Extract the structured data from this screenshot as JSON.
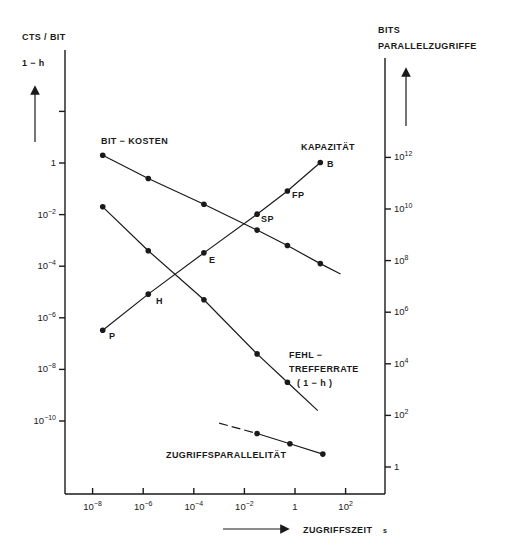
{
  "chart_data": {
    "type": "line",
    "title": "",
    "left_axis": {
      "label_lines": [
        "CTS / BIT",
        "1 − h"
      ],
      "scale": "log",
      "ticks": [
        {
          "exp": 2,
          "label": ""
        },
        {
          "exp": 0,
          "label": "1"
        },
        {
          "exp": -2,
          "label": "10",
          "sup": "−2"
        },
        {
          "exp": -4,
          "label": "10",
          "sup": "−4"
        },
        {
          "exp": -6,
          "label": "10",
          "sup": "−6"
        },
        {
          "exp": -8,
          "label": "10",
          "sup": "−8"
        },
        {
          "exp": -10,
          "label": "10",
          "sup": "−10"
        }
      ]
    },
    "right_axis": {
      "label_lines": [
        "BITS",
        "PARALLELZUGRIFFE"
      ],
      "scale": "log",
      "ticks": [
        {
          "exp": 12,
          "label": "10",
          "sup": "12"
        },
        {
          "exp": 10,
          "label": "10",
          "sup": "10"
        },
        {
          "exp": 8,
          "label": "10",
          "sup": "8"
        },
        {
          "exp": 6,
          "label": "10",
          "sup": "6"
        },
        {
          "exp": 4,
          "label": "10",
          "sup": "4"
        },
        {
          "exp": 2,
          "label": "10",
          "sup": "2"
        },
        {
          "exp": 0,
          "label": "1"
        }
      ]
    },
    "x_axis": {
      "label": "ZUGRIFFSZEIT",
      "unit": "s",
      "scale": "log",
      "ticks": [
        {
          "exp": -8,
          "label": "10",
          "sup": "−8"
        },
        {
          "exp": -6,
          "label": "10",
          "sup": "−6"
        },
        {
          "exp": -4,
          "label": "10",
          "sup": "−4"
        },
        {
          "exp": -2,
          "label": "10",
          "sup": "−2"
        },
        {
          "exp": 0,
          "label": "1"
        },
        {
          "exp": 2,
          "label": "10",
          "sup": "2"
        }
      ]
    },
    "series": [
      {
        "name": "BIT − KOSTEN",
        "axis": "left",
        "x_log10": [
          -7.6,
          -5.8,
          -3.6,
          -1.5,
          -0.3,
          1.0
        ],
        "y_log10": [
          0.3,
          -0.6,
          -1.6,
          -2.6,
          -3.2,
          -3.9
        ],
        "line_end": {
          "x_log10": 1.8,
          "y_log10": -4.3
        }
      },
      {
        "name": "KAPAZITÄT",
        "axis": "right",
        "x_log10": [
          -7.6,
          -5.8,
          -3.6,
          -1.5,
          -0.3,
          1.0
        ],
        "y_log10": [
          5.3,
          6.7,
          8.3,
          9.8,
          10.7,
          11.8
        ],
        "point_labels": [
          "P",
          "H",
          "E",
          "SP",
          "FP",
          "B"
        ]
      },
      {
        "name": "FEHL − TREFFERRATE (1 − h)",
        "axis": "left",
        "x_log10": [
          -7.6,
          -5.8,
          -3.6,
          -1.5,
          -0.3
        ],
        "y_log10": [
          -1.7,
          -3.4,
          -5.3,
          -7.4,
          -8.5
        ],
        "line_end": {
          "x_log10": 0.9,
          "y_log10": -9.6
        }
      },
      {
        "name": "ZUGRIFFSPARALLELITÄT",
        "axis": "right",
        "x_log10": [
          -1.5,
          -0.2,
          1.1
        ],
        "y_log10": [
          1.3,
          0.9,
          0.5
        ],
        "dashed_start": {
          "x_log10": -3.0,
          "y_log10": 1.7
        }
      }
    ]
  },
  "labels": {
    "bit_kosten": "BIT − KOSTEN",
    "kapazitaet": "KAPAZITÄT",
    "fehl_1": "FEHL −",
    "fehl_2": "TREFFERRATE",
    "fehl_3": "( 1 − h )",
    "zugriffsparallelitaet": "ZUGRIFFSPARALLELITÄT",
    "left_title_1": "CTS / BIT",
    "left_title_2": "1 − h",
    "right_title_1": "BITS",
    "right_title_2": "PARALLELZUGRIFFE",
    "x_title": "ZUGRIFFSZEIT",
    "x_unit": "s",
    "pt_P": "P",
    "pt_H": "H",
    "pt_E": "E",
    "pt_SP": "SP",
    "pt_FP": "FP",
    "pt_B": "B"
  }
}
